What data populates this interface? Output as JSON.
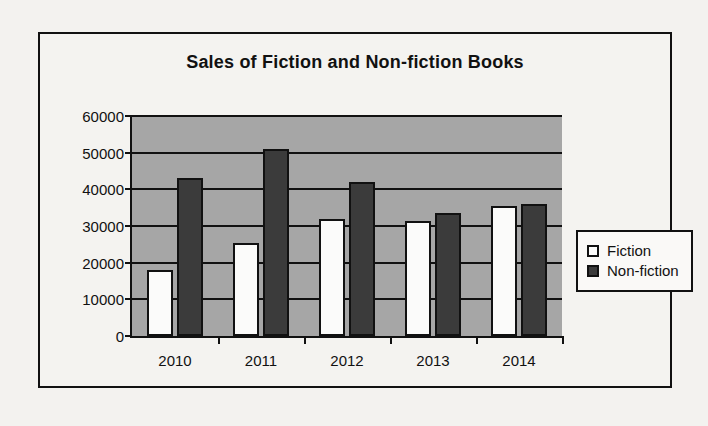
{
  "chart_data": {
    "type": "bar",
    "title": "Sales of Fiction and Non-fiction Books",
    "xlabel": "",
    "ylabel": "",
    "categories": [
      "2010",
      "2011",
      "2012",
      "2013",
      "2014"
    ],
    "series": [
      {
        "name": "Fiction",
        "color": "#fbfbfa",
        "values": [
          18000,
          25500,
          32000,
          31500,
          35500
        ]
      },
      {
        "name": "Non-fiction",
        "color": "#3b3b3b",
        "values": [
          43000,
          51000,
          42000,
          33500,
          36000
        ]
      }
    ],
    "ylim": [
      0,
      60000
    ],
    "yticks": [
      0,
      10000,
      20000,
      30000,
      40000,
      50000,
      60000
    ],
    "ytick_labels": [
      "0",
      "10000",
      "20000",
      "30000",
      "40000",
      "50000",
      "60000"
    ],
    "grid": true,
    "legend_position": "right",
    "plot_background": "#a6a6a6",
    "figure_background": "#f4f3f0"
  },
  "legend": {
    "items": [
      {
        "label": "Fiction",
        "swatch": "fiction-swatch"
      },
      {
        "label": "Non-fiction",
        "swatch": "non-fiction-swatch"
      }
    ]
  }
}
